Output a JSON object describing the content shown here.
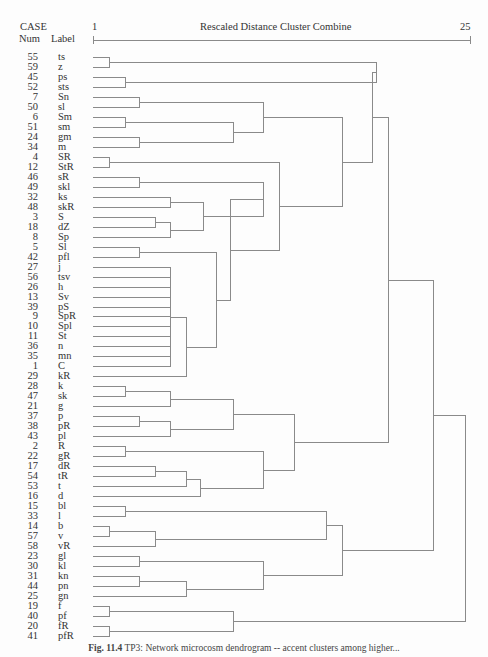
{
  "header": {
    "case_label": "CASE",
    "num_label": "Num",
    "label_label": "Label",
    "scale_min": "1",
    "scale_max": "25",
    "scale_title": "Rescaled Distance Cluster Combine"
  },
  "rows": [
    {
      "num": "55",
      "label": "ts"
    },
    {
      "num": "59",
      "label": "z"
    },
    {
      "num": "45",
      "label": "ps"
    },
    {
      "num": "52",
      "label": "sts"
    },
    {
      "num": "7",
      "label": "Sn"
    },
    {
      "num": "50",
      "label": "sl"
    },
    {
      "num": "6",
      "label": "Sm"
    },
    {
      "num": "51",
      "label": "sm"
    },
    {
      "num": "24",
      "label": "gm"
    },
    {
      "num": "34",
      "label": "m"
    },
    {
      "num": "4",
      "label": "SR"
    },
    {
      "num": "12",
      "label": "StR"
    },
    {
      "num": "46",
      "label": "sR"
    },
    {
      "num": "49",
      "label": "skl"
    },
    {
      "num": "32",
      "label": "ks"
    },
    {
      "num": "48",
      "label": "skR"
    },
    {
      "num": "3",
      "label": "S"
    },
    {
      "num": "18",
      "label": "dZ"
    },
    {
      "num": "8",
      "label": "Sp"
    },
    {
      "num": "5",
      "label": "Sl"
    },
    {
      "num": "42",
      "label": "pfl"
    },
    {
      "num": "27",
      "label": "j"
    },
    {
      "num": "56",
      "label": "tsv"
    },
    {
      "num": "26",
      "label": "h"
    },
    {
      "num": "13",
      "label": "Sv"
    },
    {
      "num": "39",
      "label": "pS"
    },
    {
      "num": "9",
      "label": "SpR"
    },
    {
      "num": "10",
      "label": "Spl"
    },
    {
      "num": "11",
      "label": "St"
    },
    {
      "num": "36",
      "label": "n"
    },
    {
      "num": "35",
      "label": "mn"
    },
    {
      "num": "1",
      "label": "C"
    },
    {
      "num": "29",
      "label": "kR"
    },
    {
      "num": "28",
      "label": "k"
    },
    {
      "num": "47",
      "label": "sk"
    },
    {
      "num": "21",
      "label": "g"
    },
    {
      "num": "37",
      "label": "p"
    },
    {
      "num": "38",
      "label": "pR"
    },
    {
      "num": "43",
      "label": "pl"
    },
    {
      "num": "2",
      "label": "R"
    },
    {
      "num": "22",
      "label": "gR"
    },
    {
      "num": "17",
      "label": "dR"
    },
    {
      "num": "54",
      "label": "tR"
    },
    {
      "num": "53",
      "label": "t"
    },
    {
      "num": "16",
      "label": "d"
    },
    {
      "num": "15",
      "label": "bl"
    },
    {
      "num": "33",
      "label": "l"
    },
    {
      "num": "14",
      "label": "b"
    },
    {
      "num": "57",
      "label": "v"
    },
    {
      "num": "58",
      "label": "vR"
    },
    {
      "num": "23",
      "label": "gl"
    },
    {
      "num": "30",
      "label": "kl"
    },
    {
      "num": "31",
      "label": "kn"
    },
    {
      "num": "44",
      "label": "pn"
    },
    {
      "num": "25",
      "label": "gn"
    },
    {
      "num": "19",
      "label": "f"
    },
    {
      "num": "40",
      "label": "pf"
    },
    {
      "num": "20",
      "label": "fR"
    },
    {
      "num": "41",
      "label": "pfR"
    }
  ],
  "caption": {
    "fig": "Fig. 11.4",
    "text": " TP3: Network microcosm dendrogram -- accent clusters among higher..."
  },
  "chart_data": {
    "type": "dendrogram",
    "title": "Rescaled Distance Cluster Combine",
    "xlabel": "Rescaled Distance Cluster Combine",
    "xlim": [
      1,
      25
    ],
    "ylabel": "CASE (Num, Label)",
    "leaf_order": [
      "ts",
      "z",
      "ps",
      "sts",
      "Sn",
      "sl",
      "Sm",
      "sm",
      "gm",
      "m",
      "SR",
      "StR",
      "sR",
      "skl",
      "ks",
      "skR",
      "S",
      "dZ",
      "Sp",
      "Sl",
      "pfl",
      "j",
      "tsv",
      "h",
      "Sv",
      "pS",
      "SpR",
      "Spl",
      "St",
      "n",
      "mn",
      "C",
      "kR",
      "k",
      "sk",
      "g",
      "p",
      "pR",
      "pl",
      "R",
      "gR",
      "dR",
      "tR",
      "t",
      "d",
      "bl",
      "l",
      "b",
      "v",
      "vR",
      "gl",
      "kl",
      "kn",
      "pn",
      "gn",
      "f",
      "pf",
      "fR",
      "pfR"
    ],
    "merges_approx": [
      {
        "a": "ts",
        "b": "z",
        "d": 2
      },
      {
        "a": "ps",
        "b": "sts",
        "d": 3
      },
      {
        "a": "Sn",
        "b": "sl",
        "d": 4
      },
      {
        "a": "Sm",
        "b": "sm",
        "d": 3
      },
      {
        "a": "gm",
        "b": "m",
        "d": 4
      },
      {
        "a": "SR",
        "b": "StR",
        "d": 2
      },
      {
        "a": "sR",
        "b": "skl",
        "d": 4
      },
      {
        "a": "ks",
        "b": "skR",
        "d": 6
      },
      {
        "a": "S",
        "b": "dZ",
        "d": 5
      },
      {
        "a": "Sl",
        "b": "pfl",
        "d": 4
      },
      {
        "a": "R",
        "b": "gR",
        "d": 3
      },
      {
        "a": "dR",
        "b": "tR",
        "d": 5
      },
      {
        "a": "k",
        "b": "sk",
        "d": 3
      },
      {
        "a": "p",
        "b": "pR",
        "d": 4
      },
      {
        "a": "bl",
        "b": "l",
        "d": 3
      },
      {
        "a": "b",
        "b": "v",
        "d": 2
      },
      {
        "a": "gl",
        "b": "kl",
        "d": 4
      },
      {
        "a": "kn",
        "b": "pn",
        "d": 4
      },
      {
        "a": "f",
        "b": "pf",
        "d": 2
      },
      {
        "a": "fR",
        "b": "pfR",
        "d": 2
      },
      {
        "a": "ts+z",
        "b": "ps+sts",
        "d": 17
      },
      {
        "a": "j..C (chained group)",
        "b": "kR",
        "d": 7
      },
      {
        "a": "all",
        "b": "",
        "d": 25
      }
    ]
  }
}
